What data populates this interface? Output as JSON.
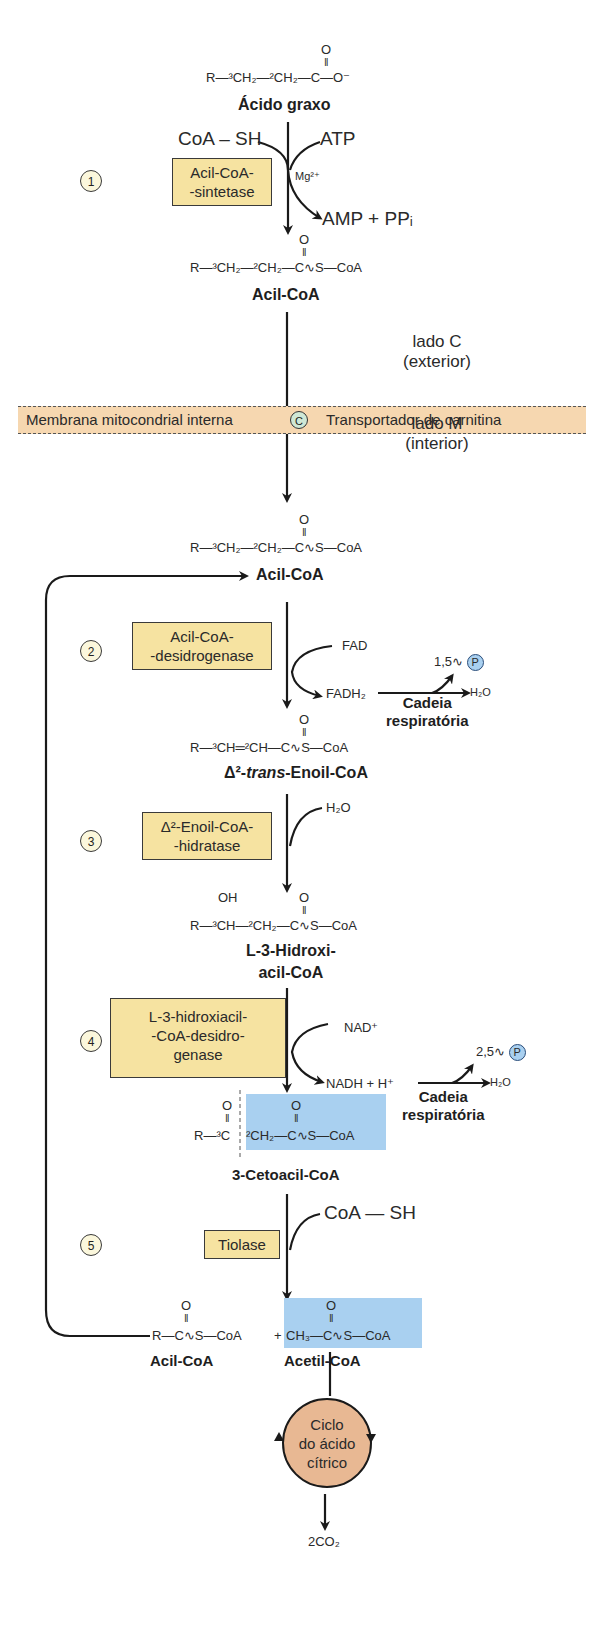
{
  "fatty_acid": {
    "formula_main": "R—³CH₂—²CH₂—C—O⁻",
    "carbonyl_o": "O",
    "name": "Ácido graxo"
  },
  "step1": {
    "number": "1",
    "enzyme_line1": "Acil-CoA-",
    "enzyme_line2": "-sintetase",
    "input_left": "CoA – SH",
    "input_right": "ATP",
    "cofactor": "Mg²⁺",
    "output": "AMP + PPᵢ"
  },
  "acylcoa_outer": {
    "formula": "R—³CH₂—²CH₂—C∿S—CoA",
    "carbonyl_o": "O",
    "name": "Acil-CoA"
  },
  "membrane": {
    "side_c_line1": "lado C",
    "side_c_line2": "(exterior)",
    "label": "Membrana mitocondrial interna",
    "transporter_symbol": "C",
    "transporter": "Transportador de carnitina",
    "side_m_line1": "lado M",
    "side_m_line2": "(interior)"
  },
  "acylcoa_inner": {
    "formula": "R—³CH₂—²CH₂—C∿S—CoA",
    "carbonyl_o": "O",
    "name": "Acil-CoA"
  },
  "step2": {
    "number": "2",
    "enzyme_line1": "Acil-CoA-",
    "enzyme_line2": "-desidrogenase",
    "input": "FAD",
    "output": "FADH₂",
    "atp_yield": "1,5∿",
    "p_symbol": "P",
    "water": "H₂O",
    "chain_line1": "Cadeia",
    "chain_line2": "respiratória"
  },
  "enoyl": {
    "formula": "R—³CH═²CH—C∿S—CoA",
    "carbonyl_o": "O",
    "name_prefix": "Δ²-",
    "name_italic": "trans",
    "name_suffix": "-Enoil-CoA"
  },
  "step3": {
    "number": "3",
    "enzyme_line1": "Δ²-Enoil-CoA-",
    "enzyme_line2": "-hidratase",
    "input": "H₂O"
  },
  "hydroxy": {
    "oh": "OH",
    "formula": "R—³CH—²CH₂—C∿S—CoA",
    "carbonyl_o": "O",
    "name_line1": "L-3-Hidroxi-",
    "name_line2": "acil-CoA"
  },
  "step4": {
    "number": "4",
    "enzyme_line1": "L-3-hidroxiacil-",
    "enzyme_line2": "-CoA-desidro-",
    "enzyme_line3": "genase",
    "input": "NAD⁺",
    "output": "NADH + H⁺",
    "atp_yield": "2,5∿",
    "p_symbol": "P",
    "water": "H₂O",
    "chain_line1": "Cadeia",
    "chain_line2": "respiratória"
  },
  "ketoacyl": {
    "formula_left": "R—³C",
    "formula_right": "²CH₂—C∿S—CoA",
    "carbonyl_o": "O",
    "name": "3-Cetoacil-CoA"
  },
  "step5": {
    "number": "5",
    "enzyme": "Tiolase",
    "input": "CoA — SH"
  },
  "products": {
    "acyl_formula": "R—C∿S—CoA",
    "plus": "+",
    "acetyl_formula": "CH₃—C∿S—CoA",
    "carbonyl_o": "O",
    "acyl_name": "Acil-CoA",
    "acetyl_name": "Acetil-CoA"
  },
  "citric_cycle": {
    "line1": "Ciclo",
    "line2": "do ácido",
    "line3": "cítrico",
    "output": "2CO₂"
  },
  "colors": {
    "enzyme_box": "#f6e3a1",
    "membrane": "#f6d7b0",
    "highlight": "#a9d0f0",
    "cycle": "#e8b893",
    "transporter": "#cfe8d6"
  }
}
